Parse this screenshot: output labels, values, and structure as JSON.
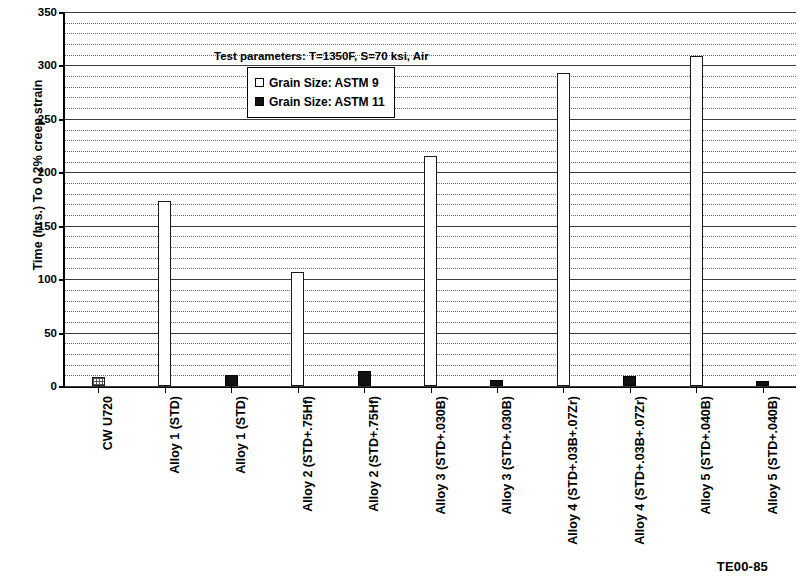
{
  "figure": {
    "code": "TE00-85",
    "annotation": "Test parameters: T=1350F, S=70 ksi, Air"
  },
  "legend": {
    "position": "inside-top-left",
    "entries": [
      {
        "label": "Grain Size: ASTM 9",
        "swatch": "light"
      },
      {
        "label": "Grain Size: ASTM 11",
        "swatch": "dark"
      }
    ]
  },
  "chart_data": {
    "type": "bar",
    "title": "",
    "subtitle": "",
    "xlabel": "",
    "ylabel": "Time (hrs.) To 0.2% creep strain",
    "ylim": [
      0,
      350
    ],
    "ytick_labels": [
      "0",
      "50",
      "100",
      "150",
      "200",
      "250",
      "300",
      "350"
    ],
    "ytick_values": [
      0,
      50,
      100,
      150,
      200,
      250,
      300,
      350
    ],
    "ytick_interval": 50,
    "minor_gridline_interval": 10,
    "grid": true,
    "grid_orientation": "horizontal",
    "annotations": [
      "Test parameters: T=1350F, S=70 ksi, Air"
    ],
    "legend_entries": [
      "Grain Size: ASTM 9",
      "Grain Size: ASTM 11"
    ],
    "categories": [
      "CW U720",
      "Alloy 1 (STD)",
      "Alloy 1 (STD)",
      "Alloy 2 (STD+.75Hf)",
      "Alloy 2 (STD+.75Hf)",
      "Alloy 3 (STD+.030B)",
      "Alloy 3 (STD+.030B)",
      "Alloy 4 (STD+.03B+.07Zr)",
      "Alloy 4 (STD+.03B+.07Zr)",
      "Alloy 5 (STD+.040B)",
      "Alloy 5 (STD+.040B)"
    ],
    "values": [
      8,
      173,
      10,
      107,
      14,
      215,
      6,
      293,
      9,
      309,
      5
    ],
    "bar_styles": [
      "hatched",
      "light",
      "dark",
      "light",
      "dark",
      "light",
      "dark",
      "light",
      "dark",
      "light",
      "dark"
    ]
  },
  "colors": {
    "series_astm9": "#ffffff",
    "series_astm11": "#111111",
    "axis": "#000000",
    "gridline": "#3a3a3a",
    "background": "#ffffff"
  }
}
